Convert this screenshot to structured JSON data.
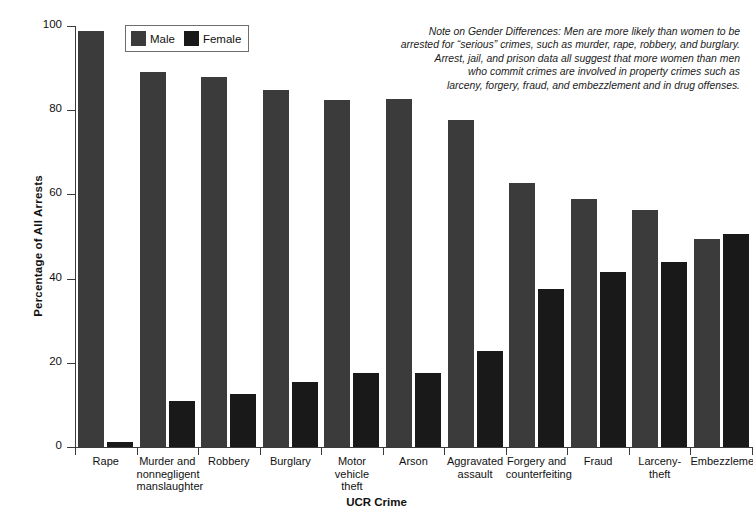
{
  "chart_data": {
    "type": "bar",
    "title": "",
    "xlabel": "UCR Crime",
    "ylabel": "Percentage of All Arrests",
    "ylim": [
      0,
      100
    ],
    "yticks": [
      0,
      20,
      40,
      60,
      80,
      100
    ],
    "grid": false,
    "legend_position": "top-left",
    "categories": [
      "Rape",
      "Murder and nonnegligent manslaughter",
      "Robbery",
      "Burglary",
      "Motor vehicle theft",
      "Arson",
      "Aggravated assault",
      "Forgery and counterfeiting",
      "Fraud",
      "Larceny-theft",
      "Embezzlement"
    ],
    "category_lines": [
      [
        "Rape"
      ],
      [
        "Murder and",
        "nonnegligent",
        "manslaughter"
      ],
      [
        "Robbery"
      ],
      [
        "Burglary"
      ],
      [
        "Motor vehicle",
        "theft"
      ],
      [
        "Arson"
      ],
      [
        "Aggravated",
        "assault"
      ],
      [
        "Forgery and",
        "counterfeiting"
      ],
      [
        "Fraud"
      ],
      [
        "Larceny-",
        "theft"
      ],
      [
        "Embezzlement"
      ]
    ],
    "series": [
      {
        "name": "Male",
        "color": "#3b3b3b",
        "values": [
          98.8,
          89.0,
          87.8,
          84.8,
          82.5,
          82.6,
          77.6,
          62.6,
          58.8,
          56.3,
          49.5
        ]
      },
      {
        "name": "Female",
        "color": "#191919",
        "values": [
          1.2,
          11.0,
          12.5,
          15.4,
          17.6,
          17.5,
          22.8,
          37.6,
          41.6,
          43.9,
          50.5
        ]
      }
    ]
  },
  "legend": {
    "items": [
      {
        "label": "Male",
        "swatch": "male"
      },
      {
        "label": "Female",
        "swatch": "female"
      }
    ]
  },
  "note": {
    "lines": [
      "Note on Gender Differences: Men are more likely than women to be",
      "arrested for “serious” crimes, such as murder, rape, robbery, and burglary.",
      "Arrest, jail, and prison data all suggest that more women than men",
      "who commit crimes are involved in property crimes such as",
      "larceny, forgery, fraud, and embezzlement and in drug offenses."
    ]
  },
  "axes": {
    "y_title": "Percentage of All Arrests",
    "x_title": "UCR Crime",
    "y_tick_labels": [
      "0",
      "20",
      "40",
      "60",
      "80",
      "100"
    ]
  }
}
